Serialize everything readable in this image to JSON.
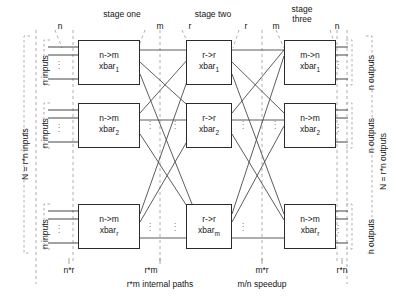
{
  "diagram": {
    "stage_titles": {
      "one": "stage one",
      "two": "stage two",
      "three_line1": "stage",
      "three_line2": "three"
    },
    "top_ticks": [
      {
        "label": "n",
        "x": 60
      },
      {
        "label": "m",
        "x": 160
      },
      {
        "label": "r",
        "x": 190
      },
      {
        "label": "r",
        "x": 246
      },
      {
        "label": "m",
        "x": 276
      },
      {
        "label": "n",
        "x": 337
      }
    ],
    "bottom_ticks": [
      {
        "label": "n*r",
        "x": 69
      },
      {
        "label": "r*m",
        "x": 151
      },
      {
        "label": "m*r",
        "x": 262
      },
      {
        "label": "r*n",
        "x": 342
      }
    ],
    "bottom_notes": [
      {
        "label": "r*m internal paths",
        "x": 160
      },
      {
        "label": "m/n speedup",
        "x": 262
      }
    ],
    "left_labels": {
      "total": "N = r*n inputs",
      "groups": [
        "n inputs",
        "n inputs",
        "n inputs"
      ]
    },
    "right_labels": {
      "total": "N = r*n outputs",
      "groups": [
        "n outputs",
        "n outputs",
        "n outputs"
      ]
    },
    "stage_one_boxes": [
      {
        "type": "n->m",
        "name": "xbar",
        "sub": "1"
      },
      {
        "type": "n->m",
        "name": "xbar",
        "sub": "2"
      },
      {
        "type": "n->m",
        "name": "xbar",
        "sub": "r"
      }
    ],
    "stage_two_boxes": [
      {
        "type": "r->r",
        "name": "xbar",
        "sub": "1"
      },
      {
        "type": "r->r",
        "name": "xbar",
        "sub": "2"
      },
      {
        "type": "r->r",
        "name": "xbar",
        "sub": "m"
      }
    ],
    "stage_three_boxes": [
      {
        "type": "m->n",
        "name": "xbar",
        "sub": "1"
      },
      {
        "type": "n->m",
        "name": "xbar",
        "sub": "2"
      },
      {
        "type": "n->m",
        "name": "xbar",
        "sub": "r"
      }
    ],
    "ellipsis_glyph": "⋮",
    "colors": {
      "line": "#3a3a3a",
      "dashed": "#8a8a8a",
      "box_border": "#2b2b2b",
      "text": "#141414",
      "background": "#ffffff"
    }
  }
}
